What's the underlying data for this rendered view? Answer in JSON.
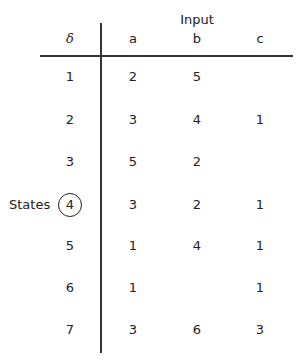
{
  "table": {
    "title": "Input",
    "corner_label": "δ",
    "row_group_label": "States",
    "highlighted_state": "4",
    "columns": [
      "a",
      "b",
      "c"
    ],
    "rows": [
      {
        "state": "1",
        "a": "2",
        "b": "5",
        "c": ""
      },
      {
        "state": "2",
        "a": "3",
        "b": "4",
        "c": "1"
      },
      {
        "state": "3",
        "a": "5",
        "b": "2",
        "c": ""
      },
      {
        "state": "4",
        "a": "3",
        "b": "2",
        "c": "1"
      },
      {
        "state": "5",
        "a": "1",
        "b": "4",
        "c": "1"
      },
      {
        "state": "6",
        "a": "1",
        "b": "",
        "c": "1"
      },
      {
        "state": "7",
        "a": "3",
        "b": "6",
        "c": "3"
      }
    ]
  }
}
